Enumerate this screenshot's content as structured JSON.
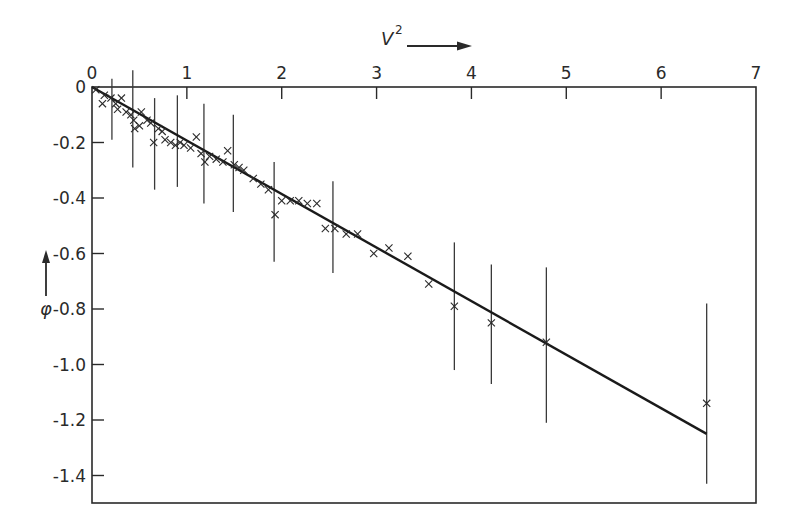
{
  "chart_data": {
    "type": "scatter",
    "title": "",
    "xlabel": "V²",
    "ylabel": "φ",
    "x_label_base": "V",
    "x_label_sup": "2",
    "xlim": [
      0,
      7
    ],
    "ylim": [
      -1.5,
      0
    ],
    "x_ticks": [
      0,
      1,
      2,
      3,
      4,
      5,
      6,
      7
    ],
    "x_tick_labels": [
      "0",
      "1",
      "2",
      "3",
      "4",
      "5",
      "6",
      "7"
    ],
    "y_ticks": [
      0,
      -0.2,
      -0.4,
      -0.6,
      -0.8,
      -1.0,
      -1.2,
      -1.4
    ],
    "y_tick_labels": [
      "0",
      "-0.2",
      "-0.4",
      "-0.6",
      "-0.8",
      "-1.0",
      "-1.2",
      "-1.4"
    ],
    "x_axis_position": "top",
    "grid": false,
    "legend": null,
    "marker": "x",
    "fit_line": {
      "x": [
        0,
        6.48
      ],
      "y": [
        0,
        -1.25
      ],
      "label": "linear fit"
    },
    "series": [
      {
        "name": "measurements",
        "points": [
          {
            "x": 0.04,
            "y": -0.01
          },
          {
            "x": 0.13,
            "y": -0.03
          },
          {
            "x": 0.11,
            "y": -0.06
          },
          {
            "x": 0.2,
            "y": -0.04
          },
          {
            "x": 0.25,
            "y": -0.06
          },
          {
            "x": 0.27,
            "y": -0.08
          },
          {
            "x": 0.31,
            "y": -0.04
          },
          {
            "x": 0.36,
            "y": -0.09
          },
          {
            "x": 0.41,
            "y": -0.1
          },
          {
            "x": 0.44,
            "y": -0.12
          },
          {
            "x": 0.45,
            "y": -0.15
          },
          {
            "x": 0.5,
            "y": -0.14
          },
          {
            "x": 0.52,
            "y": -0.09
          },
          {
            "x": 0.58,
            "y": -0.12
          },
          {
            "x": 0.62,
            "y": -0.13
          },
          {
            "x": 0.65,
            "y": -0.2
          },
          {
            "x": 0.7,
            "y": -0.15
          },
          {
            "x": 0.74,
            "y": -0.16
          },
          {
            "x": 0.77,
            "y": -0.19
          },
          {
            "x": 0.83,
            "y": -0.2
          },
          {
            "x": 0.88,
            "y": -0.21
          },
          {
            "x": 0.93,
            "y": -0.2
          },
          {
            "x": 0.97,
            "y": -0.21
          },
          {
            "x": 1.04,
            "y": -0.22
          },
          {
            "x": 1.1,
            "y": -0.18
          },
          {
            "x": 1.15,
            "y": -0.24
          },
          {
            "x": 1.19,
            "y": -0.27
          },
          {
            "x": 1.24,
            "y": -0.25
          },
          {
            "x": 1.31,
            "y": -0.26
          },
          {
            "x": 1.38,
            "y": -0.27
          },
          {
            "x": 1.43,
            "y": -0.23
          },
          {
            "x": 1.5,
            "y": -0.28
          },
          {
            "x": 1.55,
            "y": -0.29
          },
          {
            "x": 1.6,
            "y": -0.3
          },
          {
            "x": 1.7,
            "y": -0.33
          },
          {
            "x": 1.78,
            "y": -0.35
          },
          {
            "x": 1.86,
            "y": -0.37
          },
          {
            "x": 1.93,
            "y": -0.46
          },
          {
            "x": 2.0,
            "y": -0.41
          },
          {
            "x": 2.09,
            "y": -0.41
          },
          {
            "x": 2.18,
            "y": -0.41
          },
          {
            "x": 2.27,
            "y": -0.42
          },
          {
            "x": 2.37,
            "y": -0.42
          },
          {
            "x": 2.46,
            "y": -0.51
          },
          {
            "x": 2.56,
            "y": -0.51
          },
          {
            "x": 2.68,
            "y": -0.53
          },
          {
            "x": 2.8,
            "y": -0.53
          },
          {
            "x": 2.97,
            "y": -0.6
          },
          {
            "x": 3.13,
            "y": -0.58
          },
          {
            "x": 3.33,
            "y": -0.61
          },
          {
            "x": 3.55,
            "y": -0.71
          },
          {
            "x": 3.82,
            "y": -0.79
          },
          {
            "x": 4.21,
            "y": -0.85
          },
          {
            "x": 4.79,
            "y": -0.92
          },
          {
            "x": 6.48,
            "y": -1.14
          }
        ]
      }
    ],
    "error_bars": [
      {
        "x": 0.21,
        "low": -0.19,
        "high": 0.03
      },
      {
        "x": 0.43,
        "low": -0.29,
        "high": 0.06
      },
      {
        "x": 0.66,
        "low": -0.37,
        "high": -0.04
      },
      {
        "x": 0.9,
        "low": -0.36,
        "high": -0.03
      },
      {
        "x": 1.18,
        "low": -0.42,
        "high": -0.06
      },
      {
        "x": 1.49,
        "low": -0.45,
        "high": -0.1
      },
      {
        "x": 1.92,
        "low": -0.63,
        "high": -0.27
      },
      {
        "x": 2.54,
        "low": -0.67,
        "high": -0.34
      },
      {
        "x": 3.82,
        "low": -1.02,
        "high": -0.56
      },
      {
        "x": 4.21,
        "low": -1.07,
        "high": -0.64
      },
      {
        "x": 4.79,
        "low": -1.21,
        "high": -0.65
      },
      {
        "x": 6.48,
        "low": -1.43,
        "high": -0.78
      }
    ]
  },
  "colors": {
    "ink": "#2a2a2a",
    "background": "#ffffff"
  }
}
